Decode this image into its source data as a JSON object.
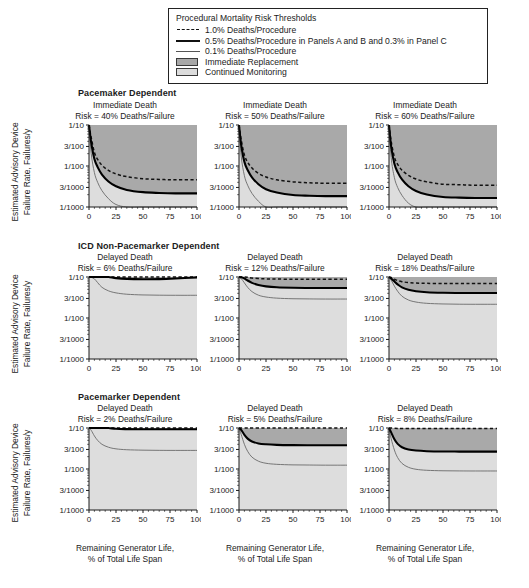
{
  "legend": {
    "title": "Procedural Mortality Risk Thresholds",
    "items": [
      {
        "key": "dashed-line",
        "label": "1.0% Deaths/Procedure"
      },
      {
        "key": "thick-solid-line",
        "label": "0.5% Deaths/Procedure in Panels A and B and 0.3% in Panel C"
      },
      {
        "key": "thin-solid-line",
        "label": "0.1% Deaths/Procedure"
      },
      {
        "key": "dark-gray-swatch",
        "label": "Immediate Replacement"
      },
      {
        "key": "light-gray-swatch",
        "label": "Continued Monitoring"
      }
    ]
  },
  "axes": {
    "ylabel_line1": "Estimated Advisory Device",
    "ylabel_line2": "Failure Rate, Failures/y",
    "xlabel_line1": "Remaining Generator Life,",
    "xlabel_line2": "% of Total Life Span",
    "yticks": [
      "1/10",
      "3/100",
      "1/100",
      "3/1000",
      "1/1000"
    ],
    "xticks": [
      "0",
      "25",
      "50",
      "75",
      "100"
    ]
  },
  "row_headers": [
    "Pacemaker Dependent",
    "ICD Non-Pacemarker Dependent",
    "Pacemarker Dependent"
  ],
  "colors": {
    "immediate_replacement": "#a9a9a9",
    "continued_monitoring": "#dddddd",
    "threshold_1pct": "#111111",
    "threshold_05pct": "#000000",
    "threshold_01pct": "#6a6a6a",
    "axis": "#1b1b1b"
  },
  "chart_data": {
    "type": "line",
    "xlabel": "Remaining Generator Life, % of Total Life Span",
    "ylabel": "Estimated Advisory Device Failure Rate, Failures/y",
    "xlim": [
      0,
      100
    ],
    "ylim": [
      0.001,
      0.1
    ],
    "yscale": "log",
    "grid": false,
    "legend_position": "top-center-box",
    "panels": [
      {
        "id": "A1",
        "row": "Pacemaker Dependent",
        "title_line1": "Immediate Death",
        "title_line2": "Risk = 40% Deaths/Failure",
        "risk_pct": 40,
        "death_type": "Immediate Death",
        "x": [
          0,
          2,
          5,
          8,
          12,
          18,
          25,
          35,
          50,
          65,
          80,
          100
        ],
        "series": [
          {
            "name": "1.0% Deaths/Procedure",
            "style": "dashed",
            "values": [
              0.1,
              0.05,
              0.0215,
              0.0145,
              0.0104,
              0.0078,
              0.0064,
              0.0055,
              0.0049,
              0.0047,
              0.0046,
              0.0046
            ]
          },
          {
            "name": "0.5% Deaths/Procedure",
            "style": "thick",
            "values": [
              0.1,
              0.038,
              0.0148,
              0.0094,
              0.0062,
              0.0042,
              0.0032,
              0.0026,
              0.0023,
              0.0022,
              0.00215,
              0.00215
            ]
          },
          {
            "name": "0.1% Deaths/Procedure",
            "style": "thin",
            "values": [
              0.1,
              0.0205,
              0.0069,
              0.004,
              0.0025,
              0.0016,
              0.00115,
              0.001,
              0.00093,
              0.0009,
              0.00089,
              0.00089
            ]
          }
        ],
        "shading": {
          "boundary_series": "0.5% Deaths/Procedure",
          "above": "Immediate Replacement",
          "below": "Continued Monitoring"
        }
      },
      {
        "id": "A2",
        "row": "Pacemaker Dependent",
        "title_line1": "Immediate Death",
        "title_line2": "Risk = 50% Deaths/Failure",
        "risk_pct": 50,
        "death_type": "Immediate Death",
        "x": [
          0,
          2,
          5,
          8,
          12,
          18,
          25,
          35,
          50,
          65,
          80,
          100
        ],
        "series": [
          {
            "name": "1.0% Deaths/Procedure",
            "style": "dashed",
            "values": [
              0.1,
              0.044,
              0.0185,
              0.0124,
              0.0089,
              0.0066,
              0.0054,
              0.0046,
              0.0041,
              0.0039,
              0.0038,
              0.0038
            ]
          },
          {
            "name": "0.5% Deaths/Procedure",
            "style": "thick",
            "values": [
              0.1,
              0.033,
              0.0126,
              0.008,
              0.0053,
              0.0036,
              0.0027,
              0.00225,
              0.00196,
              0.00188,
              0.00184,
              0.00184
            ]
          },
          {
            "name": "0.1% Deaths/Procedure",
            "style": "thin",
            "values": [
              0.1,
              0.0175,
              0.0058,
              0.0034,
              0.00215,
              0.00138,
              0.001,
              0.00087,
              0.00081,
              0.00079,
              0.00078,
              0.00078
            ]
          }
        ],
        "shading": {
          "boundary_series": "0.5% Deaths/Procedure",
          "above": "Immediate Replacement",
          "below": "Continued Monitoring"
        }
      },
      {
        "id": "A3",
        "row": "Pacemaker Dependent",
        "title_line1": "Immediate Death",
        "title_line2": "Risk = 60% Deaths/Failure",
        "risk_pct": 60,
        "death_type": "Immediate Death",
        "x": [
          0,
          2,
          5,
          8,
          12,
          18,
          25,
          35,
          50,
          65,
          80,
          100
        ],
        "series": [
          {
            "name": "1.0% Deaths/Procedure",
            "style": "dashed",
            "values": [
              0.1,
              0.04,
              0.0165,
              0.011,
              0.0079,
              0.0059,
              0.0048,
              0.0041,
              0.0036,
              0.0035,
              0.0034,
              0.0034
            ]
          },
          {
            "name": "0.5% Deaths/Procedure",
            "style": "thick",
            "values": [
              0.1,
              0.03,
              0.0113,
              0.0071,
              0.0047,
              0.0032,
              0.00245,
              0.00202,
              0.00176,
              0.00169,
              0.00166,
              0.00166
            ]
          },
          {
            "name": "0.1% Deaths/Procedure",
            "style": "thin",
            "values": [
              0.1,
              0.016,
              0.0052,
              0.003,
              0.00192,
              0.00124,
              0.0009,
              0.00078,
              0.00073,
              0.00071,
              0.0007,
              0.0007
            ]
          }
        ],
        "shading": {
          "boundary_series": "0.5% Deaths/Procedure",
          "above": "Immediate Replacement",
          "below": "Continued Monitoring"
        }
      },
      {
        "id": "B1",
        "row": "ICD Non-Pacemarker Dependent",
        "title_line1": "Delayed Death",
        "title_line2": "Risk = 6% Deaths/Failure",
        "risk_pct": 6,
        "death_type": "Delayed Death",
        "x": [
          0,
          2,
          5,
          8,
          12,
          18,
          25,
          35,
          50,
          65,
          80,
          100
        ],
        "series": [
          {
            "name": "1.0% Deaths/Procedure",
            "style": "dashed",
            "values": [
              0.1,
              0.1,
              0.1,
              0.1,
              0.1,
              0.1,
              0.1,
              0.1,
              0.1,
              0.1,
              0.1,
              0.1
            ]
          },
          {
            "name": "0.5% Deaths/Procedure",
            "style": "thick",
            "values": [
              0.1,
              0.1,
              0.1,
              0.1,
              0.1,
              0.1,
              0.094,
              0.09,
              0.0885,
              0.089,
              0.092,
              0.098
            ]
          },
          {
            "name": "0.1% Deaths/Procedure",
            "style": "thin",
            "values": [
              0.1,
              0.098,
              0.09,
              0.073,
              0.056,
              0.046,
              0.041,
              0.038,
              0.0365,
              0.036,
              0.0358,
              0.0358
            ]
          }
        ],
        "shading": {
          "boundary_series": "0.5% Deaths/Procedure",
          "above": "Immediate Replacement",
          "below": "Continued Monitoring"
        }
      },
      {
        "id": "B2",
        "row": "ICD Non-Pacemarker Dependent",
        "title_line1": "Delayed Death",
        "title_line2": "Risk = 12% Deaths/Failure",
        "risk_pct": 12,
        "death_type": "Delayed Death",
        "x": [
          0,
          2,
          5,
          8,
          12,
          18,
          25,
          35,
          50,
          65,
          80,
          100
        ],
        "series": [
          {
            "name": "1.0% Deaths/Procedure",
            "style": "dashed",
            "values": [
              0.1,
              0.1,
              0.1,
              0.098,
              0.094,
              0.092,
              0.09,
              0.089,
              0.0885,
              0.0885,
              0.0885,
              0.0885
            ]
          },
          {
            "name": "0.5% Deaths/Procedure",
            "style": "thick",
            "values": [
              0.1,
              0.098,
              0.092,
              0.082,
              0.072,
              0.064,
              0.059,
              0.056,
              0.0545,
              0.054,
              0.0538,
              0.0538
            ]
          },
          {
            "name": "0.1% Deaths/Procedure",
            "style": "thin",
            "values": [
              0.1,
              0.092,
              0.072,
              0.056,
              0.044,
              0.036,
              0.0325,
              0.0305,
              0.0295,
              0.0292,
              0.029,
              0.029
            ]
          }
        ],
        "shading": {
          "boundary_series": "0.5% Deaths/Procedure",
          "above": "Immediate Replacement",
          "below": "Continued Monitoring"
        }
      },
      {
        "id": "B3",
        "row": "ICD Non-Pacemarker Dependent",
        "title_line1": "Delayed Death",
        "title_line2": "Risk = 18% Deaths/Failure",
        "risk_pct": 18,
        "death_type": "Delayed Death",
        "x": [
          0,
          2,
          5,
          8,
          12,
          18,
          25,
          35,
          50,
          65,
          80,
          100
        ],
        "series": [
          {
            "name": "1.0% Deaths/Procedure",
            "style": "dashed",
            "values": [
              0.1,
              0.097,
              0.089,
              0.082,
              0.077,
              0.073,
              0.071,
              0.07,
              0.0695,
              0.0693,
              0.0692,
              0.0692
            ]
          },
          {
            "name": "0.5% Deaths/Procedure",
            "style": "thick",
            "values": [
              0.1,
              0.092,
              0.078,
              0.066,
              0.056,
              0.049,
              0.045,
              0.0425,
              0.0412,
              0.0408,
              0.0406,
              0.0406
            ]
          },
          {
            "name": "0.1% Deaths/Procedure",
            "style": "thin",
            "values": [
              0.1,
              0.084,
              0.06,
              0.045,
              0.034,
              0.0275,
              0.0245,
              0.0228,
              0.022,
              0.0217,
              0.0216,
              0.0216
            ]
          }
        ],
        "shading": {
          "boundary_series": "0.5% Deaths/Procedure",
          "above": "Immediate Replacement",
          "below": "Continued Monitoring"
        }
      },
      {
        "id": "C1",
        "row": "Pacemarker Dependent",
        "title_line1": "Delayed Death",
        "title_line2": "Risk = 2% Deaths/Failure",
        "risk_pct": 2,
        "death_type": "Delayed Death",
        "x": [
          0,
          2,
          5,
          8,
          12,
          18,
          25,
          35,
          50,
          65,
          80,
          100
        ],
        "series": [
          {
            "name": "1.0% Deaths/Procedure",
            "style": "dashed",
            "values": [
              0.1,
              0.1,
              0.1,
              0.1,
              0.1,
              0.1,
              0.1,
              0.1,
              0.1,
              0.1,
              0.1,
              0.1
            ]
          },
          {
            "name": "0.3% Deaths/Procedure",
            "style": "thick",
            "values": [
              0.1,
              0.1,
              0.1,
              0.1,
              0.1,
              0.1,
              0.0955,
              0.094,
              0.0932,
              0.093,
              0.0929,
              0.0929
            ]
          },
          {
            "name": "0.1% Deaths/Procedure",
            "style": "thin",
            "values": [
              0.1,
              0.088,
              0.064,
              0.05,
              0.04,
              0.034,
              0.031,
              0.0295,
              0.0288,
              0.0285,
              0.0284,
              0.0284
            ]
          }
        ],
        "shading": {
          "boundary_series": "0.3% Deaths/Procedure",
          "above": "Immediate Replacement",
          "below": "Continued Monitoring"
        }
      },
      {
        "id": "C2",
        "row": "Pacemarker Dependent",
        "title_line1": "Delayed Death",
        "title_line2": "Risk = 5% Deaths/Failure",
        "risk_pct": 5,
        "death_type": "Delayed Death",
        "x": [
          0,
          2,
          5,
          8,
          12,
          18,
          25,
          35,
          50,
          65,
          80,
          100
        ],
        "series": [
          {
            "name": "1.0% Deaths/Procedure",
            "style": "dashed",
            "values": [
              0.1,
              0.1,
              0.1,
              0.1,
              0.1,
              0.1,
              0.1,
              0.1,
              0.1,
              0.1,
              0.1,
              0.1
            ]
          },
          {
            "name": "0.3% Deaths/Procedure",
            "style": "thick",
            "values": [
              0.1,
              0.09,
              0.068,
              0.055,
              0.047,
              0.042,
              0.04,
              0.0388,
              0.0382,
              0.038,
              0.0379,
              0.0379
            ]
          },
          {
            "name": "0.1% Deaths/Procedure",
            "style": "thin",
            "values": [
              0.1,
              0.07,
              0.04,
              0.027,
              0.0195,
              0.0155,
              0.0138,
              0.013,
              0.0126,
              0.0125,
              0.0124,
              0.0124
            ]
          }
        ],
        "shading": {
          "boundary_series": "0.3% Deaths/Procedure",
          "above": "Immediate Replacement",
          "below": "Continued Monitoring"
        }
      },
      {
        "id": "C3",
        "row": "Pacemarker Dependent",
        "title_line1": "Delayed Death",
        "title_line2": "Risk = 8% Deaths/Failure",
        "risk_pct": 8,
        "death_type": "Delayed Death",
        "x": [
          0,
          2,
          5,
          8,
          12,
          18,
          25,
          35,
          50,
          65,
          80,
          100
        ],
        "series": [
          {
            "name": "1.0% Deaths/Procedure",
            "style": "dashed",
            "values": [
              0.1,
              0.1,
              0.0985,
              0.0975,
              0.097,
              0.0968,
              0.0967,
              0.0966,
              0.0966,
              0.0966,
              0.0966,
              0.0966
            ]
          },
          {
            "name": "0.3% Deaths/Procedure",
            "style": "thick",
            "values": [
              0.1,
              0.078,
              0.053,
              0.041,
              0.034,
              0.03,
              0.0282,
              0.0272,
              0.0267,
              0.0266,
              0.0265,
              0.0265
            ]
          },
          {
            "name": "0.1% Deaths/Procedure",
            "style": "thin",
            "values": [
              0.1,
              0.055,
              0.029,
              0.019,
              0.0137,
              0.011,
              0.00985,
              0.0093,
              0.00905,
              0.00898,
              0.00895,
              0.00895
            ]
          }
        ],
        "shading": {
          "boundary_series": "0.3% Deaths/Procedure",
          "above": "Immediate Replacement",
          "below": "Continued Monitoring"
        }
      }
    ]
  }
}
